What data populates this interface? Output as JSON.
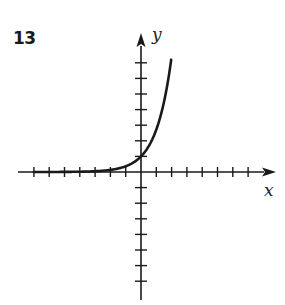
{
  "problem": {
    "number": "13"
  },
  "chart_data": {
    "type": "line",
    "title": "",
    "xlabel": "x",
    "ylabel": "y",
    "xlim": [
      -8,
      8
    ],
    "ylim": [
      -8,
      8
    ],
    "grid": false,
    "legend": null,
    "x_ticks": [
      -7,
      -6,
      -5,
      -4,
      -3,
      -2,
      -1,
      1,
      2,
      3,
      4,
      5,
      6,
      7
    ],
    "y_ticks": [
      -7,
      -6,
      -5,
      -4,
      -3,
      -2,
      -1,
      1,
      2,
      3,
      4,
      5,
      6,
      7
    ],
    "tick_labels_shown": false,
    "series": [
      {
        "name": "exponential curve",
        "equation_estimate": "y = e^x",
        "x": [
          -7,
          -6,
          -5,
          -4,
          -3,
          -2,
          -1,
          -0.5,
          0,
          0.5,
          1,
          1.5,
          2
        ],
        "y": [
          0.001,
          0.002,
          0.007,
          0.018,
          0.05,
          0.14,
          0.37,
          0.61,
          1.0,
          1.65,
          2.72,
          4.48,
          7.2
        ]
      }
    ],
    "annotations": [
      {
        "text": "y-intercept",
        "x": 0,
        "y": 1
      }
    ]
  },
  "colors": {
    "ink": "#1a1a1a",
    "background": "#ffffff"
  }
}
